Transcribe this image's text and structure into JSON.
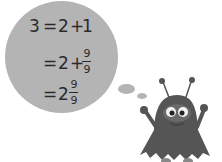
{
  "equation": {
    "row1": {
      "lhs": "3",
      "eq": "=",
      "a": "2",
      "op": "+",
      "b": "1"
    },
    "row2": {
      "eq": "=",
      "a": "2",
      "op": "+",
      "num": "9",
      "den": "9"
    },
    "row3": {
      "eq": "=",
      "whole": "2",
      "num": "9",
      "den": "9"
    }
  },
  "colors": {
    "bubble": "#b4b4b4",
    "text": "#2a2a2a",
    "monster": "#555555"
  }
}
